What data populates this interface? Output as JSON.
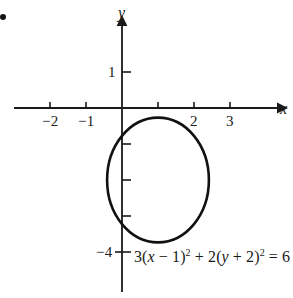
{
  "figure": {
    "background_color": "#ffffff",
    "ink_color": "#1a1a1a",
    "corner_mark": "bullet-dot"
  },
  "axes": {
    "x_axis_label": "x",
    "y_axis_label": "y",
    "x_tick_labels": [
      "-2",
      "-1",
      "2",
      "3"
    ],
    "y_tick_labels": [
      "1",
      "-4"
    ],
    "origin_label": "",
    "x_label_minus2": "−2",
    "x_label_minus1": "−1",
    "x_label_2": "2",
    "x_label_3": "3",
    "y_label_1": "1",
    "y_label_minus4": "−4"
  },
  "equation": {
    "full_text": "3(x − 1)² + 2(y + 2)² = 6",
    "part_coef_a": "3(",
    "part_var_x": "x",
    "part_x_shift": " − 1)",
    "part_exp_1": "2",
    "part_plus": " + 2(",
    "part_var_y": "y",
    "part_y_shift": " + 2)",
    "part_exp_2": "2",
    "part_equals": " = 6"
  },
  "chart_data": {
    "type": "line",
    "title": "",
    "subtitle": "",
    "xlabel": "x",
    "ylabel": "y",
    "xlim": [
      -3,
      4.3
    ],
    "ylim": [
      -4.5,
      2.3
    ],
    "grid": false,
    "legend": null,
    "xticks": [
      -2,
      -1,
      2,
      3
    ],
    "xtick_labels": [
      "−2",
      "−1",
      "2",
      "3"
    ],
    "yticks": [
      1,
      -1,
      -2,
      -3,
      -4
    ],
    "ytick_labels": [
      "1",
      "",
      "",
      "",
      "−4"
    ],
    "annotations": [
      {
        "text": "3(x − 1)² + 2(y + 2)² = 6",
        "x": 0.35,
        "y": -4.15
      }
    ],
    "series": [
      {
        "name": "ellipse",
        "curve": "ellipse",
        "equation": "3(x - 1)^2 + 2(y + 2)^2 = 6",
        "center": [
          1,
          -2
        ],
        "semi_axis_x": 1.414,
        "semi_axis_y": 1.732,
        "x_intercepts_range": [
          -0.41,
          2.41
        ],
        "y_intercepts_range": [
          -3.73,
          -0.27
        ],
        "stroke_width": 2.6,
        "color": "#111111"
      }
    ],
    "axis_style": {
      "arrow_x_positive": true,
      "arrow_y_positive": true,
      "tick_length": 7,
      "unit_pixels": 36,
      "origin_pixel": [
        122,
        108
      ]
    }
  }
}
